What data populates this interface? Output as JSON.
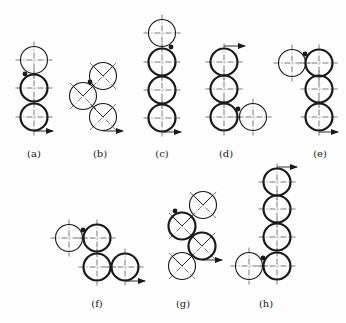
{
  "canvas": {
    "width": 346,
    "height": 323,
    "background": "#fdfdfd"
  },
  "style": {
    "stroke": "#1a1a1a",
    "thin": 1.1,
    "thick": 2.2,
    "centerline": "#444444",
    "radius": 13.5
  },
  "figures": [
    {
      "id": "a",
      "label": "(a)",
      "label_pos": [
        34,
        157
      ],
      "centerlines": "cross",
      "circles": [
        {
          "c": [
            34,
            60
          ],
          "thick": false
        },
        {
          "c": [
            34,
            88
          ],
          "thick": true
        },
        {
          "c": [
            34,
            117
          ],
          "thick": true
        }
      ],
      "dot": [
        25,
        74
      ],
      "arrow": {
        "from": [
          34,
          131
        ],
        "to": [
          53,
          131
        ]
      }
    },
    {
      "id": "b",
      "label": "(b)",
      "label_pos": [
        100,
        157
      ],
      "centerlines": "diagonal",
      "circles": [
        {
          "c": [
            103,
            76
          ],
          "thick": false
        },
        {
          "c": [
            83,
            96
          ],
          "thick": false
        },
        {
          "c": [
            103,
            117
          ],
          "thick": false
        }
      ],
      "dot": [
        90,
        82
      ],
      "arrow": {
        "from": [
          103,
          131
        ],
        "to": [
          123,
          131
        ]
      }
    },
    {
      "id": "c",
      "label": "(c)",
      "label_pos": [
        162,
        157
      ],
      "centerlines": "cross",
      "circles": [
        {
          "c": [
            162,
            33
          ],
          "thick": false
        },
        {
          "c": [
            162,
            62
          ],
          "thick": true
        },
        {
          "c": [
            162,
            90
          ],
          "thick": true
        },
        {
          "c": [
            162,
            118
          ],
          "thick": true
        }
      ],
      "dot": [
        171,
        47
      ],
      "arrow": {
        "from": [
          162,
          132
        ],
        "to": [
          181,
          132
        ]
      }
    },
    {
      "id": "d",
      "label": "(d)",
      "label_pos": [
        226,
        157
      ],
      "centerlines": "cross",
      "circles": [
        {
          "c": [
            224,
            62
          ],
          "thick": true
        },
        {
          "c": [
            224,
            89
          ],
          "thick": true
        },
        {
          "c": [
            224,
            117
          ],
          "thick": true
        },
        {
          "c": [
            253,
            117
          ],
          "thick": false
        }
      ],
      "dot": [
        238,
        109
      ],
      "arrow": {
        "from": [
          224,
          46
        ],
        "to": [
          245,
          46
        ]
      }
    },
    {
      "id": "e",
      "label": "(e)",
      "label_pos": [
        320,
        157
      ],
      "centerlines": "cross",
      "circles": [
        {
          "c": [
            292,
            63
          ],
          "thick": false
        },
        {
          "c": [
            319,
            63
          ],
          "thick": true
        },
        {
          "c": [
            319,
            89
          ],
          "thick": true
        },
        {
          "c": [
            319,
            117
          ],
          "thick": true
        }
      ],
      "dot": [
        305,
        54
      ],
      "arrow": {
        "from": [
          319,
          132
        ],
        "to": [
          338,
          132
        ]
      }
    },
    {
      "id": "f",
      "label": "(f)",
      "label_pos": [
        97,
        307
      ],
      "centerlines": "cross",
      "circles": [
        {
          "c": [
            69,
            238
          ],
          "thick": false
        },
        {
          "c": [
            97,
            238
          ],
          "thick": true
        },
        {
          "c": [
            97,
            267
          ],
          "thick": true
        },
        {
          "c": [
            125,
            267
          ],
          "thick": true
        }
      ],
      "dot": [
        83,
        230
      ],
      "arrow": {
        "from": [
          125,
          281
        ],
        "to": [
          145,
          281
        ]
      }
    },
    {
      "id": "g",
      "label": "(g)",
      "label_pos": [
        183,
        307
      ],
      "centerlines": "diagonal",
      "circles": [
        {
          "c": [
            203,
            205
          ],
          "thick": false
        },
        {
          "c": [
            182,
            226
          ],
          "thick": true
        },
        {
          "c": [
            202,
            246
          ],
          "thick": true
        },
        {
          "c": [
            182,
            266
          ],
          "thick": false
        }
      ],
      "dot": [
        175,
        211
      ],
      "arrow": {
        "from": [
          202,
          260
        ],
        "to": [
          222,
          260
        ]
      }
    },
    {
      "id": "h",
      "label": "(h)",
      "label_pos": [
        266,
        307
      ],
      "centerlines": "cross",
      "circles": [
        {
          "c": [
            277,
            182
          ],
          "thick": true
        },
        {
          "c": [
            277,
            209
          ],
          "thick": true
        },
        {
          "c": [
            277,
            237
          ],
          "thick": true
        },
        {
          "c": [
            277,
            266
          ],
          "thick": true
        },
        {
          "c": [
            249,
            266
          ],
          "thick": false
        }
      ],
      "dot": [
        263,
        258
      ],
      "arrow": {
        "from": [
          277,
          167
        ],
        "to": [
          297,
          167
        ]
      }
    }
  ]
}
